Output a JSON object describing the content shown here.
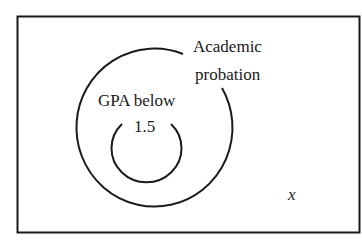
{
  "diagram": {
    "type": "venn",
    "universe_label": "x",
    "sets": [
      {
        "name": "Academic probation",
        "label_lines": [
          "Academic",
          "probation"
        ]
      },
      {
        "name": "GPA below 1.5",
        "label_lines": [
          "GPA below",
          "1.5"
        ],
        "subset_of": "Academic probation"
      }
    ],
    "colors": {
      "stroke": "#1a1a1a",
      "background": "#ffffff"
    }
  }
}
